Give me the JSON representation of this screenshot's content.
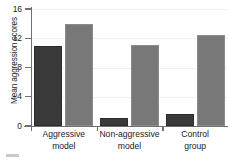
{
  "chart_data": {
    "type": "bar",
    "title": "",
    "subtitle": "",
    "xlabel": "",
    "ylabel": "Mean aggression scores",
    "categories": [
      "Aggressive model",
      "Non-aggressive model",
      "Control group"
    ],
    "category_lines": [
      [
        "Aggressive",
        "model"
      ],
      [
        "Non-aggressive",
        "model"
      ],
      [
        "Control",
        "group"
      ]
    ],
    "series": [
      {
        "name": "dark-series",
        "color": "#3a3a3a",
        "values": [
          10.9,
          1.1,
          1.6
        ]
      },
      {
        "name": "gray-series",
        "color": "#787878",
        "values": [
          13.9,
          11.1,
          12.4
        ]
      }
    ],
    "ylim": [
      0,
      16
    ],
    "yticks": [
      0,
      4,
      8,
      12,
      16
    ],
    "ytick_labels": [
      "0",
      "4",
      "8",
      "12",
      "16"
    ],
    "grid": true,
    "grid_color": "#f0f0f0",
    "legend": false,
    "legend_position": "none",
    "axis_color": "#6f6f6f",
    "background": "#ffffff"
  },
  "axis": {
    "y_title": "Mean aggression scores",
    "tick_16": "16",
    "tick_12": "12",
    "tick_8": "8",
    "tick_4": "4",
    "tick_0": "0"
  },
  "categories": {
    "c0_line1": "Aggressive",
    "c0_line2": "model",
    "c1_line1": "Non-aggressive",
    "c1_line2": "model",
    "c2_line1": "Control",
    "c2_line2": "group"
  }
}
